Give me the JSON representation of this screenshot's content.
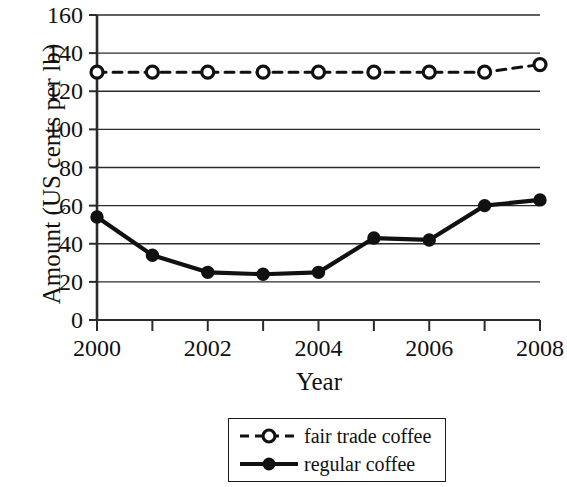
{
  "chart_data": {
    "type": "line",
    "title": "",
    "xlabel": "Year",
    "ylabel": "Amount (US cents per lb)",
    "x": [
      2000,
      2001,
      2002,
      2003,
      2004,
      2005,
      2006,
      2007,
      2008
    ],
    "xtick_labels": [
      "2000",
      "2002",
      "2004",
      "2006",
      "2008"
    ],
    "xtick_values": [
      2000,
      2002,
      2004,
      2006,
      2008
    ],
    "xlim": [
      2000,
      2008
    ],
    "ytick_labels": [
      "0",
      "20",
      "40",
      "60",
      "80",
      "100",
      "120",
      "140",
      "160"
    ],
    "ytick_values": [
      0,
      20,
      40,
      60,
      80,
      100,
      120,
      140,
      160
    ],
    "ylim": [
      0,
      160
    ],
    "grid": "horizontal",
    "legend_position": "below-plot",
    "series": [
      {
        "name": "fair trade coffee",
        "values": [
          130,
          130,
          130,
          130,
          130,
          130,
          130,
          130,
          134
        ],
        "line_style": "dashed",
        "marker": "open-circle",
        "color": "#111111"
      },
      {
        "name": "regular coffee",
        "values": [
          54,
          34,
          25,
          24,
          25,
          43,
          42,
          60,
          63
        ],
        "line_style": "solid",
        "marker": "filled-circle",
        "color": "#111111"
      }
    ]
  },
  "legend": {
    "items": [
      {
        "label": "fair trade coffee"
      },
      {
        "label": "regular coffee"
      }
    ]
  }
}
